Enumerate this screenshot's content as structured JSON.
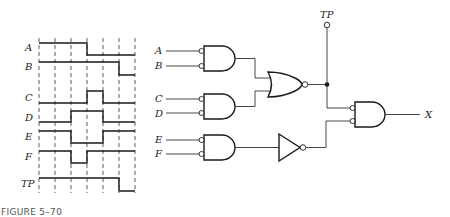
{
  "figure": {
    "caption": "FIGURE 5–70"
  },
  "timing_diagram": {
    "signals": [
      {
        "name": "A",
        "levels": [
          1,
          1,
          1,
          0,
          0,
          0
        ]
      },
      {
        "name": "B",
        "levels": [
          1,
          1,
          1,
          1,
          1,
          0
        ]
      },
      {
        "name": "C",
        "levels": [
          0,
          0,
          0,
          1,
          0,
          0
        ]
      },
      {
        "name": "D",
        "levels": [
          0,
          0,
          1,
          1,
          0,
          0
        ]
      },
      {
        "name": "E",
        "levels": [
          1,
          1,
          0,
          0,
          1,
          1
        ]
      },
      {
        "name": "F",
        "levels": [
          1,
          1,
          0,
          1,
          1,
          1
        ]
      },
      {
        "name": "TP",
        "levels": [
          1,
          1,
          1,
          1,
          1,
          0
        ]
      }
    ],
    "intervals": 6
  },
  "circuit": {
    "inputs": [
      "A",
      "B",
      "C",
      "D",
      "E",
      "F"
    ],
    "test_point_label": "TP",
    "output_label": "X",
    "gates": [
      {
        "id": "and1",
        "type": "AND",
        "inverted_inputs": true,
        "inputs": [
          "A",
          "B"
        ]
      },
      {
        "id": "and2",
        "type": "AND",
        "inverted_inputs": true,
        "inputs": [
          "C",
          "D"
        ]
      },
      {
        "id": "nor1",
        "type": "NOR",
        "inputs": [
          "and1",
          "and2"
        ]
      },
      {
        "id": "and3",
        "type": "AND",
        "inverted_inputs": true,
        "inputs": [
          "E",
          "F"
        ]
      },
      {
        "id": "inv1",
        "type": "NOT",
        "inputs": [
          "and3"
        ]
      },
      {
        "id": "and4",
        "type": "AND",
        "inverted_inputs": true,
        "inputs": [
          "nor1",
          "inv1"
        ],
        "output": "X"
      }
    ]
  }
}
